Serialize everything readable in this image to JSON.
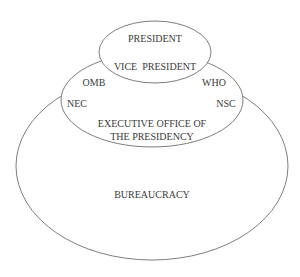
{
  "diagram": {
    "type": "nested-ellipse-organization",
    "nodes": [
      {
        "id": "president-circle",
        "labels": [
          "PRESIDENT",
          "VICE  PRESIDENT"
        ]
      },
      {
        "id": "executive-office",
        "labels": [
          "OMB",
          "WHO",
          "NEC",
          "NSC",
          "EXECUTIVE OFFICE OF",
          "THE PRESIDENCY"
        ]
      },
      {
        "id": "bureaucracy",
        "labels": [
          "BUREAUCRACY"
        ]
      }
    ]
  },
  "labels": {
    "president": "PRESIDENT",
    "vice_president": "VICE  PRESIDENT",
    "omb": "OMB",
    "who": "WHO",
    "nec": "NEC",
    "nsc": "NSC",
    "eop_line1": "EXECUTIVE OFFICE OF",
    "eop_line2": "THE PRESIDENCY",
    "bureaucracy": "BUREAUCRACY"
  },
  "colors": {
    "stroke": "#6e6e6e",
    "text": "#3a3a3a",
    "background": "#ffffff"
  }
}
